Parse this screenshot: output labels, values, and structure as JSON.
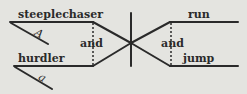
{
  "diagram": {
    "type": "sentence-diagram",
    "subjects": [
      {
        "word": "steeplechaser",
        "modifier": "A"
      },
      {
        "word": "hurdler",
        "modifier": "a"
      }
    ],
    "subject_conjunction": "and",
    "predicates": [
      {
        "word": "run"
      },
      {
        "word": "jump"
      }
    ],
    "predicate_conjunction": "and",
    "colors": {
      "background": "#e4e4e0",
      "ink": "#2a2a2a"
    }
  }
}
